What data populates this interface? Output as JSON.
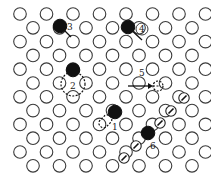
{
  "diagram": {
    "type": "crystal-lattice-point-defects",
    "lattice": {
      "rows": 12,
      "row_pitch": 13.8,
      "col_pitch": 26.5,
      "y0": 14,
      "x_even_start": 20,
      "x_odd_start": 33,
      "atom_radius": 6.3
    },
    "defects": [
      {
        "id": "1",
        "label": "1",
        "x": 115,
        "y": 112,
        "label_x": 112,
        "label_y": 130
      },
      {
        "id": "2",
        "label": "2",
        "x": 73,
        "y": 70,
        "label_x": 70,
        "label_y": 89
      },
      {
        "id": "3",
        "label": "3",
        "x": 60,
        "y": 26,
        "label_x": 67,
        "label_y": 30
      },
      {
        "id": "4",
        "label": "4",
        "x": 128,
        "y": 27,
        "label_x": 139,
        "label_y": 32
      },
      {
        "id": "5",
        "label": "5",
        "x": 142,
        "y": 86,
        "label_x": 139,
        "label_y": 76
      },
      {
        "id": "6",
        "label": "6",
        "x": 148,
        "y": 133,
        "label_x": 150,
        "label_y": 149
      }
    ],
    "arrow_atoms": [
      {
        "x": 184,
        "y": 98
      },
      {
        "x": 171,
        "y": 111
      },
      {
        "x": 160,
        "y": 123
      },
      {
        "x": 136,
        "y": 146
      },
      {
        "x": 124,
        "y": 158
      }
    ]
  }
}
